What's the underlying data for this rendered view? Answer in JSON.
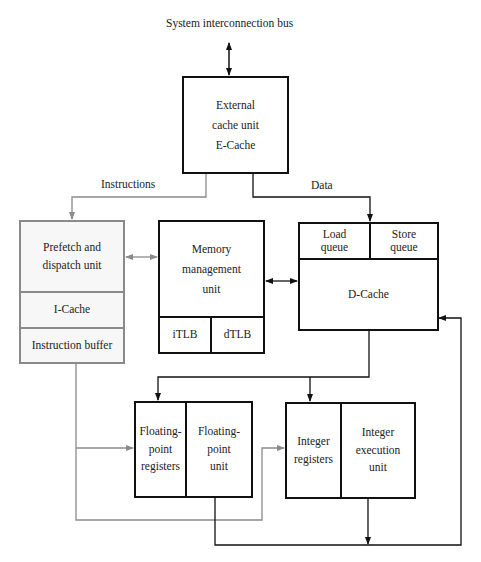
{
  "bus_label": "System interconnection bus",
  "ecache": {
    "text": "External\ncache unit\nE-Cache"
  },
  "edges": {
    "instructions": "Instructions",
    "data": "Data"
  },
  "prefetch": {
    "dispatch": "Prefetch and\ndispatch unit",
    "icache": "I-Cache",
    "ibuffer": "Instruction buffer"
  },
  "mmu": {
    "text": "Memory\nmanagement\nunit",
    "itlb": "iTLB",
    "dtlb": "dTLB"
  },
  "dcache": {
    "load_queue": "Load\nqueue",
    "store_queue": "Store\nqueue",
    "text": "D-Cache"
  },
  "fp": {
    "registers": "Floating-\npoint\nregisters",
    "unit": "Floating-\npoint\nunit"
  },
  "int": {
    "registers": "Integer\nregisters",
    "unit": "Integer\nexecution\nunit"
  },
  "colors": {
    "dark_line": "#111111",
    "gray_line": "#8a8a8a"
  }
}
